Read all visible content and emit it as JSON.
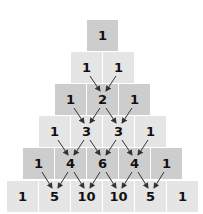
{
  "colors": {
    "dark_cell": "#cdcdcd",
    "light_cell": "#e5e5e5",
    "arrow": "#333333",
    "text": "#111111"
  },
  "rows": [
    [
      "1"
    ],
    [
      "1",
      "1"
    ],
    [
      "1",
      "2",
      "1"
    ],
    [
      "1",
      "3",
      "3",
      "1"
    ],
    [
      "1",
      "4",
      "6",
      "4",
      "1"
    ],
    [
      "1",
      "5",
      "10",
      "10",
      "5",
      "1"
    ]
  ]
}
